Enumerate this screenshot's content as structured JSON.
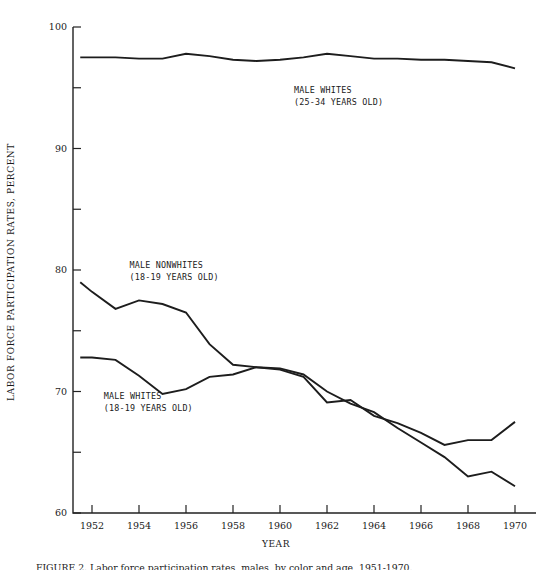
{
  "figure": {
    "caption": "FIGURE 2.  Labor force participation rates, males, by color and age, 1951-1970."
  },
  "chart_data": {
    "type": "line",
    "title": "",
    "xlabel": "YEAR",
    "ylabel": "LABOR FORCE PARTICIPATION RATES, PERCENT",
    "xlim": [
      1951.5,
      1970.5
    ],
    "ylim": [
      60,
      100
    ],
    "grid": false,
    "legend": "inline-annotations",
    "y_major_ticks": [
      60,
      70,
      80,
      90,
      100
    ],
    "y_minor_ticks": [
      65,
      75,
      85,
      95
    ],
    "y_tick_labels": [
      "60",
      "70",
      "80",
      "90",
      "100"
    ],
    "x_ticks": [
      1952,
      1954,
      1956,
      1958,
      1960,
      1962,
      1964,
      1966,
      1968,
      1970
    ],
    "x_tick_labels": [
      "1952",
      "1954",
      "1956",
      "1958",
      "1960",
      "1962",
      "1964",
      "1966",
      "1968",
      "1970"
    ],
    "x": [
      1951.5,
      1952,
      1953,
      1954,
      1955,
      1956,
      1957,
      1958,
      1959,
      1960,
      1961,
      1962,
      1963,
      1964,
      1965,
      1966,
      1967,
      1968,
      1969,
      1970
    ],
    "series": [
      {
        "name": "MALE WHITES (25-34 YEARS OLD)",
        "label_line1": "MALE WHITES",
        "label_line2": "(25-34 YEARS OLD)",
        "label_x": 1960.6,
        "label_y": 94.6,
        "color": "#1d1d1d",
        "values": [
          97.5,
          97.5,
          97.5,
          97.4,
          97.4,
          97.8,
          97.6,
          97.3,
          97.2,
          97.3,
          97.5,
          97.8,
          97.6,
          97.4,
          97.4,
          97.3,
          97.3,
          97.2,
          97.1,
          96.6
        ]
      },
      {
        "name": "MALE NONWHITES (18-19 YEARS OLD)",
        "label_line1": "MALE NONWHITES",
        "label_line2": "(18-19 YEARS OLD)",
        "label_x": 1953.6,
        "label_y": 80.2,
        "color": "#1d1d1d",
        "values": [
          79.0,
          78.2,
          76.8,
          77.5,
          77.2,
          76.5,
          73.9,
          72.2,
          72.0,
          71.9,
          71.4,
          70.0,
          69.0,
          68.3,
          67.0,
          65.8,
          64.6,
          63.0,
          63.4,
          62.2
        ]
      },
      {
        "name": "MALE WHITES (18-19 YEARS OLD)",
        "label_line1": "MALE WHITES",
        "label_line2": "(18-19 YEARS OLD)",
        "label_x": 1952.5,
        "label_y": 69.4,
        "color": "#1d1d1d",
        "values": [
          72.8,
          72.8,
          72.6,
          71.3,
          69.8,
          70.2,
          71.2,
          71.4,
          72.0,
          71.8,
          71.2,
          69.1,
          69.3,
          68.0,
          67.4,
          66.6,
          65.6,
          66.0,
          66.0,
          67.5
        ]
      }
    ]
  }
}
